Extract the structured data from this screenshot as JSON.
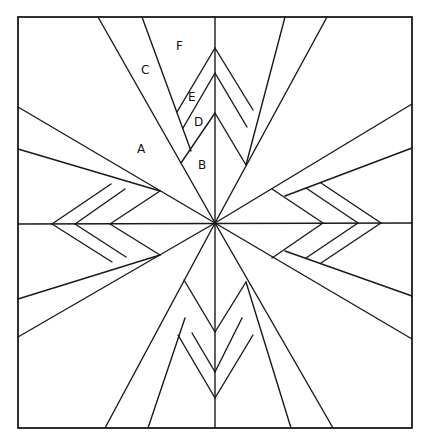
{
  "diagram": {
    "type": "quilt-block-pattern",
    "stroke_color": "#1a1a1a",
    "background": "#ffffff",
    "frame": {
      "x": 18,
      "y": 17,
      "width": 394,
      "height": 411
    },
    "center": [
      215,
      223
    ],
    "labels": [
      {
        "text": "F",
        "x": 176,
        "y": 50
      },
      {
        "text": "C",
        "x": 141,
        "y": 74
      },
      {
        "text": "E",
        "x": 188,
        "y": 101
      },
      {
        "text": "D",
        "x": 194,
        "y": 126
      },
      {
        "text": "A",
        "x": 137,
        "y": 153
      },
      {
        "text": "B",
        "x": 198,
        "y": 169
      }
    ],
    "segments": [
      [
        215,
        17,
        215,
        428
      ],
      [
        18,
        224,
        412,
        223
      ],
      [
        98,
        17,
        215,
        223
      ],
      [
        142,
        17,
        191,
        151
      ],
      [
        327,
        17,
        215,
        223
      ],
      [
        285,
        17,
        246,
        165
      ],
      [
        18,
        107,
        215,
        223
      ],
      [
        18,
        149,
        160,
        191
      ],
      [
        18,
        337,
        215,
        223
      ],
      [
        18,
        299,
        160,
        255
      ],
      [
        412,
        104,
        215,
        223
      ],
      [
        412,
        148,
        285,
        196
      ],
      [
        412,
        339,
        215,
        223
      ],
      [
        412,
        296,
        285,
        251
      ],
      [
        105,
        428,
        215,
        223
      ],
      [
        148,
        428,
        185,
        318
      ],
      [
        333,
        428,
        215,
        223
      ],
      [
        291,
        428,
        246,
        282
      ],
      [
        215,
        48,
        177,
        112
      ],
      [
        215,
        73,
        183,
        128
      ],
      [
        215,
        113,
        181,
        163
      ],
      [
        215,
        48,
        253,
        110
      ],
      [
        215,
        73,
        247,
        127
      ],
      [
        215,
        113,
        246,
        165
      ],
      [
        52,
        224,
        111,
        184
      ],
      [
        75,
        224,
        125,
        189
      ],
      [
        110,
        224,
        160,
        191
      ],
      [
        52,
        224,
        112,
        262
      ],
      [
        75,
        224,
        126,
        257
      ],
      [
        110,
        224,
        160,
        255
      ],
      [
        323,
        223,
        272,
        189
      ],
      [
        358,
        223,
        306,
        188
      ],
      [
        381,
        223,
        321,
        183
      ],
      [
        323,
        223,
        272,
        258
      ],
      [
        358,
        223,
        306,
        258
      ],
      [
        381,
        223,
        321,
        263
      ],
      [
        215,
        332,
        184,
        280
      ],
      [
        215,
        372,
        192,
        333
      ],
      [
        215,
        398,
        178,
        335
      ],
      [
        215,
        332,
        246,
        282
      ],
      [
        215,
        372,
        242,
        318
      ],
      [
        215,
        398,
        253,
        335
      ]
    ]
  }
}
